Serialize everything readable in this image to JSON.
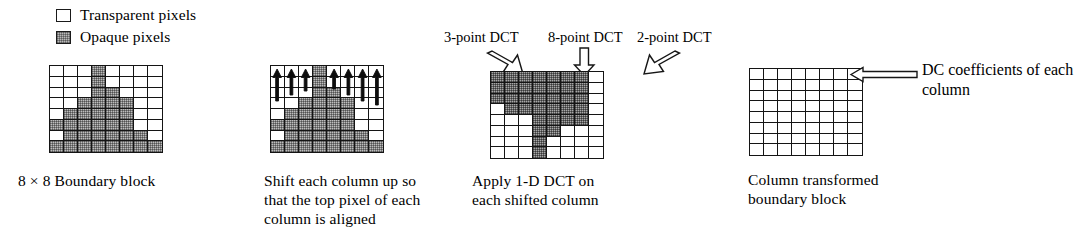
{
  "legend": {
    "items": [
      {
        "icon": "transparent-pixel-swatch",
        "label": "Transparent pixels",
        "fill": "#ffffff"
      },
      {
        "icon": "opaque-pixel-swatch",
        "label": "Opaque pixels",
        "fill": "#bdbdbd"
      }
    ]
  },
  "panels": [
    {
      "id": "boundary-block",
      "caption": "8 × 8 Boundary block",
      "grid": {
        "rows": 8,
        "cols": 8,
        "legend_key": {
          "t": "transparent",
          "o": "opaque"
        },
        "cells": [
          [
            "t",
            "t",
            "t",
            "o",
            "t",
            "t",
            "t",
            "t"
          ],
          [
            "t",
            "t",
            "t",
            "o",
            "t",
            "t",
            "t",
            "t"
          ],
          [
            "t",
            "t",
            "t",
            "o",
            "o",
            "t",
            "t",
            "t"
          ],
          [
            "t",
            "t",
            "o",
            "o",
            "o",
            "o",
            "t",
            "t"
          ],
          [
            "t",
            "o",
            "o",
            "o",
            "o",
            "o",
            "t",
            "t"
          ],
          [
            "o",
            "o",
            "o",
            "o",
            "o",
            "o",
            "t",
            "t"
          ],
          [
            "t",
            "o",
            "o",
            "o",
            "o",
            "o",
            "o",
            "t"
          ],
          [
            "o",
            "o",
            "o",
            "o",
            "o",
            "o",
            "o",
            "o"
          ]
        ]
      }
    },
    {
      "id": "shifted-block",
      "caption": "Shift each column up so\nthat the top pixel of each\ncolumn is aligned",
      "annotation": "up-shift-arrows",
      "grid": {
        "rows": 8,
        "cols": 8,
        "cells": [
          [
            "t",
            "t",
            "t",
            "o",
            "t",
            "t",
            "t",
            "t"
          ],
          [
            "t",
            "t",
            "t",
            "o",
            "t",
            "t",
            "t",
            "t"
          ],
          [
            "t",
            "t",
            "t",
            "o",
            "o",
            "t",
            "t",
            "t"
          ],
          [
            "t",
            "t",
            "o",
            "o",
            "o",
            "o",
            "t",
            "t"
          ],
          [
            "t",
            "o",
            "o",
            "o",
            "o",
            "o",
            "t",
            "t"
          ],
          [
            "o",
            "o",
            "o",
            "o",
            "o",
            "o",
            "t",
            "t"
          ],
          [
            "t",
            "o",
            "o",
            "o",
            "o",
            "o",
            "o",
            "t"
          ],
          [
            "o",
            "o",
            "o",
            "o",
            "o",
            "o",
            "o",
            "o"
          ]
        ]
      }
    },
    {
      "id": "dct-block",
      "caption": "Apply 1-D DCT on\neach shifted column",
      "callouts": [
        {
          "label": "3-point DCT",
          "target_column": 1
        },
        {
          "label": "8-point DCT",
          "target_column": 4
        },
        {
          "label": "2-point DCT",
          "target_column": 7
        }
      ],
      "grid": {
        "rows": 8,
        "cols": 8,
        "cells": [
          [
            "o",
            "o",
            "o",
            "o",
            "o",
            "o",
            "o",
            "t"
          ],
          [
            "o",
            "o",
            "o",
            "o",
            "o",
            "o",
            "o",
            "t"
          ],
          [
            "o",
            "o",
            "o",
            "o",
            "o",
            "o",
            "o",
            "t"
          ],
          [
            "t",
            "o",
            "o",
            "o",
            "o",
            "o",
            "o",
            "t"
          ],
          [
            "t",
            "t",
            "t",
            "o",
            "o",
            "o",
            "o",
            "t"
          ],
          [
            "t",
            "t",
            "t",
            "o",
            "o",
            "t",
            "t",
            "t"
          ],
          [
            "t",
            "t",
            "t",
            "o",
            "t",
            "t",
            "t",
            "t"
          ],
          [
            "t",
            "t",
            "t",
            "o",
            "t",
            "t",
            "t",
            "t"
          ]
        ]
      }
    },
    {
      "id": "column-transformed-block",
      "caption": "Column transformed\nboundary block",
      "annotation": "DC coefficients of each\ncolumn",
      "grid": {
        "rows": 8,
        "cols": 8,
        "cells": [
          [
            "t",
            "t",
            "t",
            "t",
            "t",
            "t",
            "t",
            "t"
          ],
          [
            "t",
            "t",
            "t",
            "t",
            "t",
            "t",
            "t",
            "t"
          ],
          [
            "t",
            "t",
            "t",
            "t",
            "t",
            "t",
            "t",
            "t"
          ],
          [
            "t",
            "t",
            "t",
            "t",
            "t",
            "t",
            "t",
            "t"
          ],
          [
            "t",
            "t",
            "t",
            "t",
            "t",
            "t",
            "t",
            "t"
          ],
          [
            "t",
            "t",
            "t",
            "t",
            "t",
            "t",
            "t",
            "t"
          ],
          [
            "t",
            "t",
            "t",
            "t",
            "t",
            "t",
            "t",
            "t"
          ],
          [
            "t",
            "t",
            "t",
            "t",
            "t",
            "t",
            "t",
            "t"
          ]
        ]
      }
    }
  ]
}
